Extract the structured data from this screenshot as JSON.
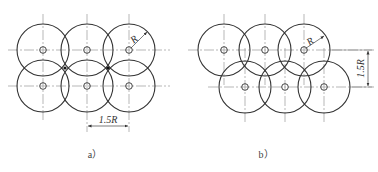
{
  "figures": [
    {
      "id": "a",
      "caption": "a）",
      "layout": "square-grid",
      "radius_label": "R",
      "spacing_label": "1.5R",
      "spacing_direction": "horizontal",
      "rows": 2,
      "cols": 3
    },
    {
      "id": "b",
      "caption": "b）",
      "layout": "staggered",
      "radius_label": "R",
      "spacing_label": "1.5R",
      "spacing_direction": "vertical",
      "rows": 2,
      "cols": 3
    }
  ]
}
